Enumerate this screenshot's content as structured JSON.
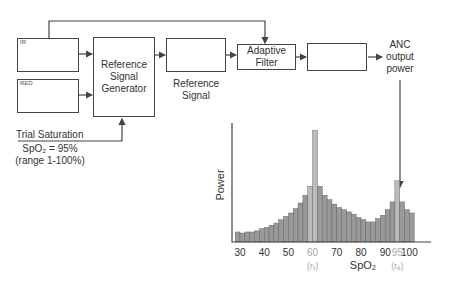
{
  "blocks": {
    "input_signal_1_label": "IR",
    "input_signal_2_label": "RED",
    "generator": [
      "Reference",
      "Signal",
      "Generator"
    ],
    "reference_signal": [
      "Reference",
      "Signal"
    ],
    "adaptive_filter": [
      "Adaptive",
      "Filter"
    ],
    "anc_output": [
      "ANC",
      "output",
      "power"
    ],
    "trial_saturation": {
      "title": "Trial Saturation",
      "value": "SpO₂ = 95%",
      "range": "(range 1-100%)"
    }
  },
  "chart_data": {
    "type": "bar",
    "title": "",
    "xlabel": "SpO₂",
    "ylabel": "Power",
    "x_ticks": [
      "30",
      "40",
      "50",
      "60",
      "70",
      "80",
      "90",
      "95",
      "100"
    ],
    "x_tick_annotations": {
      "60": "(rᵥ)",
      "95": "(rₑ)"
    },
    "highlight_color": "#bbbbbb",
    "bar_color": "#999999",
    "x": [
      29,
      31,
      33,
      35,
      37,
      39,
      41,
      43,
      45,
      47,
      49,
      51,
      53,
      55,
      57,
      59,
      61,
      63,
      65,
      67,
      69,
      71,
      73,
      75,
      77,
      79,
      81,
      83,
      85,
      87,
      89,
      91,
      93,
      95,
      97,
      99,
      101
    ],
    "values": [
      9,
      8,
      9,
      9,
      10,
      12,
      13,
      15,
      17,
      20,
      23,
      26,
      30,
      35,
      42,
      50,
      100,
      50,
      42,
      38,
      34,
      31,
      29,
      27,
      25,
      22,
      20,
      18,
      18,
      21,
      24,
      29,
      36,
      55,
      36,
      29,
      26
    ],
    "peaks": [
      {
        "x": 60,
        "label": "r_v"
      },
      {
        "x": 95,
        "label": "r_e"
      }
    ],
    "ylim": [
      0,
      105
    ]
  }
}
